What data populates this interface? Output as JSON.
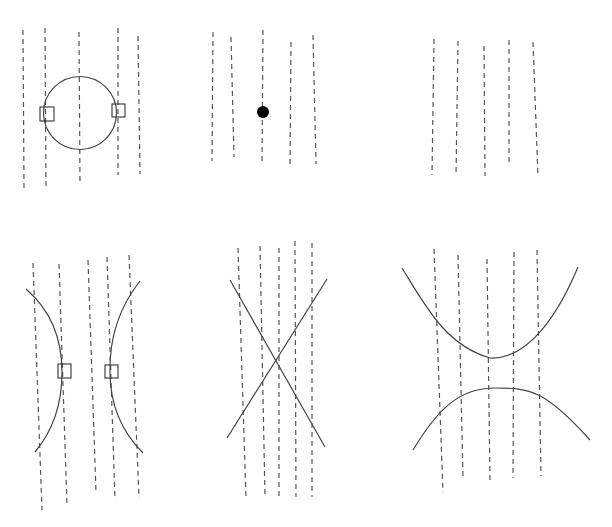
{
  "figure": {
    "colors": {
      "line": "#555555",
      "curve": "#444444",
      "marker": "#000000",
      "background": "#ffffff"
    },
    "panels": [
      {
        "id": "panel-circle",
        "row": 1,
        "col": 1,
        "dashed_line_count": 5,
        "curve": "circle",
        "tangency_markers": 2,
        "marker_shape": "square"
      },
      {
        "id": "panel-point",
        "row": 1,
        "col": 2,
        "dashed_line_count": 5,
        "curve": "point",
        "tangency_markers": 0,
        "marker_shape": "filled-dot"
      },
      {
        "id": "panel-empty",
        "row": 1,
        "col": 3,
        "dashed_line_count": 5,
        "curve": "none",
        "tangency_markers": 0
      },
      {
        "id": "panel-opposing-arcs",
        "row": 2,
        "col": 1,
        "dashed_line_count": 5,
        "curve": "two concave arcs facing outward",
        "tangency_markers": 2,
        "marker_shape": "square"
      },
      {
        "id": "panel-crossing",
        "row": 2,
        "col": 2,
        "dashed_line_count": 5,
        "curve": "two crossing straight lines (X)",
        "tangency_markers": 0
      },
      {
        "id": "panel-separated-arcs",
        "row": 2,
        "col": 3,
        "dashed_line_count": 5,
        "curve": "upper U-shaped arc and lower inverted arc",
        "tangency_markers": 0
      }
    ]
  }
}
